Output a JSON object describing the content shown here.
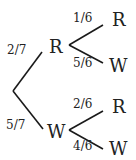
{
  "tree": {
    "root": {
      "branches": [
        {
          "prob": "2/7",
          "node": "R",
          "children": [
            {
              "prob": "1/6",
              "outcome": "R"
            },
            {
              "prob": "5/6",
              "outcome": "W"
            }
          ]
        },
        {
          "prob": "5/7",
          "node": "W",
          "children": [
            {
              "prob": "2/6",
              "outcome": "R"
            },
            {
              "prob": "4/6",
              "outcome": "W"
            }
          ]
        }
      ]
    }
  },
  "colors": {
    "line": "#1a1a1a",
    "text": "#222222",
    "background": "#ffffff"
  }
}
